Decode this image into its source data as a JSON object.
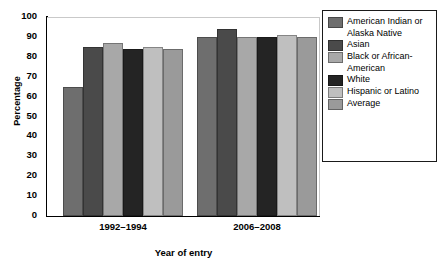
{
  "chart_data": {
    "type": "bar",
    "title": "",
    "xlabel": "Year of entry",
    "ylabel": "Percentage",
    "categories": [
      "1992–1994",
      "2006–2008"
    ],
    "ylim": [
      0,
      100
    ],
    "yticks": [
      0,
      10,
      20,
      30,
      40,
      50,
      60,
      70,
      80,
      90,
      100
    ],
    "grid": false,
    "legend_position": "right",
    "series": [
      {
        "name": "American Indian or Alaska Native",
        "color": "#6e6e6e",
        "values": [
          65,
          90
        ]
      },
      {
        "name": "Asian",
        "color": "#4a4a4a",
        "values": [
          85,
          94
        ]
      },
      {
        "name": "Black or African-American",
        "color": "#a8a8a8",
        "values": [
          87,
          90
        ]
      },
      {
        "name": "White",
        "color": "#242424",
        "values": [
          84,
          90
        ]
      },
      {
        "name": "Hispanic or Latino",
        "color": "#bfbfbf",
        "values": [
          85,
          91
        ]
      },
      {
        "name": "Average",
        "color": "#9a9a9a",
        "values": [
          84,
          90
        ]
      }
    ]
  },
  "legend": {
    "items": [
      {
        "label": "American Indian or Alaska Native",
        "color": "#6e6e6e"
      },
      {
        "label": "Asian",
        "color": "#4a4a4a"
      },
      {
        "label": "Black or African-American",
        "color": "#a8a8a8"
      },
      {
        "label": "White",
        "color": "#242424"
      },
      {
        "label": "Hispanic or Latino",
        "color": "#bfbfbf"
      },
      {
        "label": "Average",
        "color": "#9a9a9a"
      }
    ]
  }
}
